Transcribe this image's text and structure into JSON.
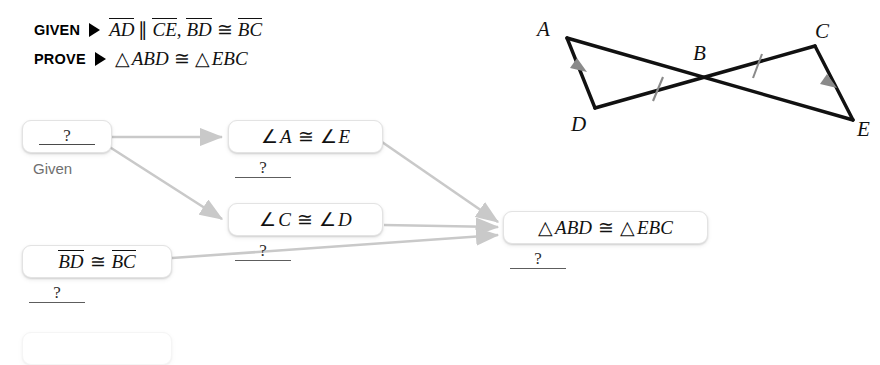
{
  "header": {
    "given_label": "GIVEN",
    "prove_label": "PROVE",
    "given_statement": {
      "seg1": "AD",
      "parallel_symbol": "∥",
      "seg2": "CE",
      "comma": ",",
      "seg3": "BD",
      "congruent_symbol": "≅",
      "seg4": "BC"
    },
    "prove_statement": {
      "triangle_symbol_1": "△",
      "tri1": "ABD",
      "congruent_symbol": "≅",
      "triangle_symbol_2": "△",
      "tri2": "EBC"
    }
  },
  "figure": {
    "labels": {
      "A": "A",
      "B": "B",
      "C": "C",
      "D": "D",
      "E": "E"
    },
    "tick_marks": 2,
    "arrow_marks": 2,
    "stroke_color": "#111111",
    "mark_color": "#8a8a8a"
  },
  "flowchart": {
    "unknown_marker": "?",
    "boxes": [
      {
        "id": "given-box",
        "content": "?",
        "reason": "Given",
        "reason_is_text": true
      },
      {
        "id": "angle-a-e",
        "angle_symbol_1": "∠",
        "v1": "A",
        "congruent_symbol": "≅",
        "angle_symbol_2": "∠",
        "v2": "E",
        "reason": "?"
      },
      {
        "id": "angle-c-d",
        "angle_symbol_1": "∠",
        "v1": "C",
        "congruent_symbol": "≅",
        "angle_symbol_2": "∠",
        "v2": "D",
        "reason": "?"
      },
      {
        "id": "bd-bc",
        "seg1": "BD",
        "congruent_symbol": "≅",
        "seg2": "BC",
        "reason": "?"
      },
      {
        "id": "conclusion",
        "triangle_symbol_1": "△",
        "tri1": "ABD",
        "congruent_symbol": "≅",
        "triangle_symbol_2": "△",
        "tri2": "EBC",
        "reason": "?"
      }
    ],
    "arrow_color": "#c9c9c9"
  }
}
